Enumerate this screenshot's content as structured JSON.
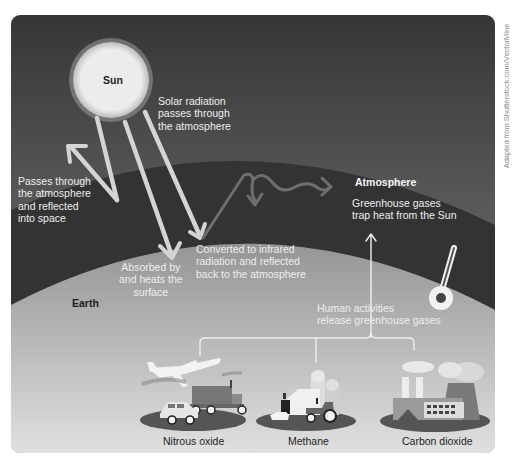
{
  "diagram": {
    "credit": "Adapted from Shutterstock.com/VectorMine",
    "colors": {
      "sky_top": "#3a3a3a",
      "sky_bottom": "#7a7a7a",
      "atmosphere_band": "#333333",
      "earth_top": "#9a9a9a",
      "earth_bottom": "#dcdcdc",
      "sun": "#e9e9e9",
      "arrow": "#d4d4d4",
      "infrared_arrow": "#6e6e6e"
    },
    "nodes": {
      "sun": "Sun",
      "atmosphere": "Atmosphere",
      "earth": "Earth"
    },
    "annotations": {
      "solar_radiation": [
        "Solar radiation",
        "passes through",
        "the atmosphere"
      ],
      "reflected": [
        "Passes through",
        "the atmosphere",
        "and reflected",
        "into space"
      ],
      "absorbed": [
        "Absorbed by",
        "and heats the",
        "surface"
      ],
      "converted": [
        "Converted to infrared",
        "radiation and reflected",
        "back to the atmosphere"
      ],
      "greenhouse": [
        "Greenhouse gases",
        "trap heat from the Sun"
      ],
      "human": [
        "Human activities",
        "release greenhouse gases"
      ]
    },
    "sources": [
      {
        "label": "Nitrous oxide",
        "icons": [
          "airplane",
          "truck",
          "car"
        ]
      },
      {
        "label": "Methane",
        "icons": [
          "farm-silo",
          "barn",
          "cow",
          "tractor"
        ]
      },
      {
        "label": "Carbon dioxide",
        "icons": [
          "factory",
          "smokestacks",
          "cooling-tower"
        ]
      }
    ]
  }
}
